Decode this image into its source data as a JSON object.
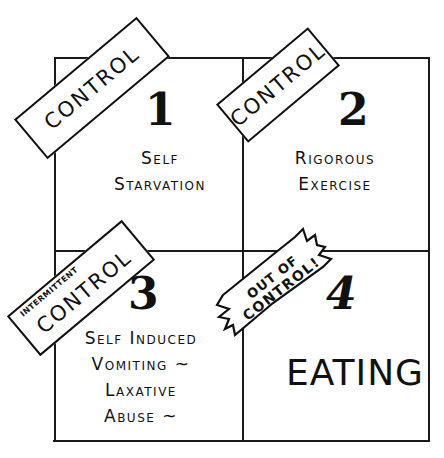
{
  "diagram": {
    "type": "2x2 hand-drawn quadrant grid",
    "line_color": "#1a1a1a",
    "background": "#ffffff",
    "quadrants": [
      {
        "number": "1",
        "tag": "CONTROL",
        "lines": [
          "Self",
          "Starvation"
        ]
      },
      {
        "number": "2",
        "tag": "CONTROL",
        "lines": [
          "Rigorous",
          "Exercise"
        ]
      },
      {
        "number": "3",
        "tag_prefix": "INTERMITTENT",
        "tag": "CONTROL",
        "lines": [
          "Self Induced",
          "Vomiting ~",
          "Laxative",
          "Abuse ~"
        ]
      },
      {
        "number": "4",
        "tag_line1": "OUT OF",
        "tag_line2": "CONTROL!",
        "lines": [
          "EATING"
        ]
      }
    ]
  }
}
